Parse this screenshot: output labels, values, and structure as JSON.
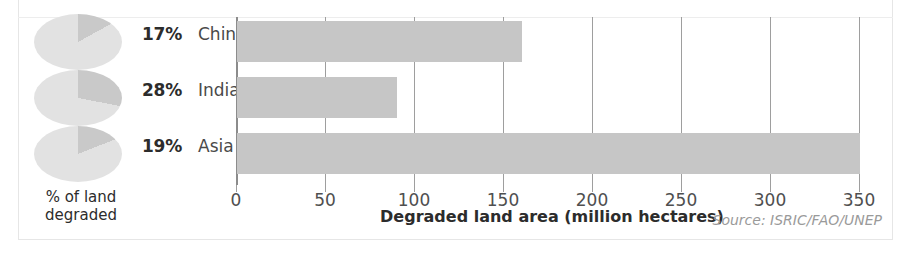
{
  "chart_data": {
    "type": "bar",
    "orientation": "horizontal",
    "title": "",
    "xlabel": "Degraded land area (million hectares)",
    "ylabel": "",
    "xlim": [
      0,
      355
    ],
    "xticks": [
      0,
      50,
      100,
      150,
      200,
      250,
      300,
      350
    ],
    "xticklabels": [
      "0",
      "50",
      "100",
      "150",
      "200",
      "250",
      "300",
      "350"
    ],
    "grid": true,
    "legend": "none",
    "categories": [
      "China",
      "India",
      "Asia"
    ],
    "values": [
      160,
      90,
      350
    ],
    "series": [
      {
        "name": "Degraded land area (million hectares)",
        "values": [
          160,
          90,
          350
        ]
      }
    ],
    "bar_color": "#c6c6c6",
    "source": "Source: ISRIC/FAO/UNEP",
    "inset_pies": {
      "type": "pie",
      "caption": "% of land degraded",
      "pie_color_slice": "#c9c9c9",
      "pie_color_rest": "#e2e2e2",
      "items": [
        {
          "label": "China",
          "percent": 17,
          "percent_text": "17%"
        },
        {
          "label": "India",
          "percent": 28,
          "percent_text": "28%"
        },
        {
          "label": "Asia",
          "percent": 19,
          "percent_text": "19%"
        }
      ]
    }
  },
  "rows": [
    {
      "percent_text": "17%",
      "country": "China",
      "percent": 17,
      "bar_value": 160
    },
    {
      "percent_text": "28%",
      "country": "India",
      "percent": 28,
      "bar_value": 90
    },
    {
      "percent_text": "19%",
      "country": "Asia",
      "percent": 19,
      "bar_value": 350
    }
  ],
  "axis": {
    "ticks": [
      "0",
      "50",
      "100",
      "150",
      "200",
      "250",
      "300",
      "350"
    ],
    "title": "Degraded land area (million hectares)"
  },
  "legend_caption": "% of land degraded",
  "source": "Source: ISRIC/FAO/UNEP",
  "colors": {
    "bar": "#c6c6c6",
    "pie_slice": "#c9c9c9",
    "pie_base": "#e2e2e2",
    "gridline": "#9e9e9e",
    "text": "#2c2c2c"
  }
}
